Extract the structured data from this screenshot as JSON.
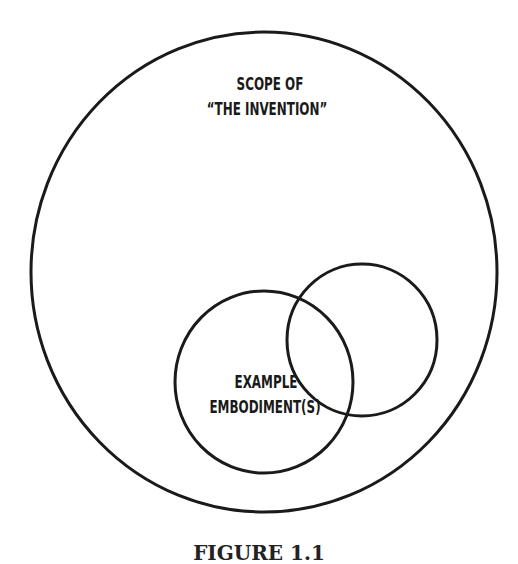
{
  "diagram": {
    "outer_set": {
      "label_line1": "SCOPE OF",
      "label_line2": "“THE INVENTION”"
    },
    "inner_set": {
      "label_line1": "EXAMPLE",
      "label_line2": "EMBODIMENT(S)"
    },
    "caption": "FIGURE 1.1",
    "stroke_color": "#1a1a1a"
  }
}
